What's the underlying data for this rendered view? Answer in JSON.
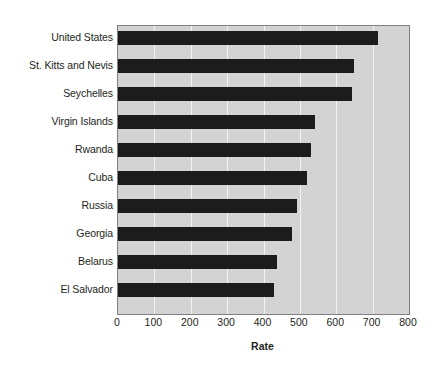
{
  "chart_data": {
    "type": "bar",
    "orientation": "horizontal",
    "title": "",
    "xlabel": "Rate",
    "ylabel": "",
    "xlim": [
      0,
      800
    ],
    "xticks": [
      0,
      100,
      200,
      300,
      400,
      500,
      600,
      700,
      800
    ],
    "xtick_labels": [
      "0",
      "100",
      "200",
      "300",
      "400",
      "500",
      "600",
      "700",
      "800"
    ],
    "grid": true,
    "legend": false,
    "categories": [
      "United States",
      "St. Kitts and Nevis",
      "Seychelles",
      "Virgin Islands",
      "Rwanda",
      "Cuba",
      "Russia",
      "Georgia",
      "Belarus",
      "El Salvador"
    ],
    "values": [
      716,
      648,
      643,
      541,
      530,
      519,
      492,
      478,
      437,
      428
    ],
    "series": [
      {
        "name": "Rate",
        "values": [
          716,
          648,
          643,
          541,
          530,
          519,
          492,
          478,
          437,
          428
        ]
      }
    ]
  },
  "style": {
    "bar_color": "#1c1c1c",
    "plot_background": "#d3d3d3",
    "gridline_color": "#f2f2f2",
    "plot_border_color": "#808080",
    "figure_background": "#ffffff",
    "text_color": "#231f20"
  }
}
